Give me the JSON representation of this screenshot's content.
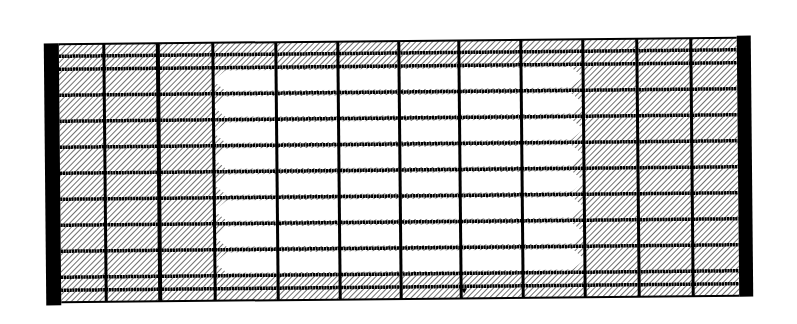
{
  "diagram": {
    "type": "hatched-grid-schematic",
    "rotation_deg": -0.55,
    "colors": {
      "background": "#ffffff",
      "ink": "#000000",
      "hatch_fill": "#ffffff",
      "hatch_line": "#4a4a4a",
      "open_band": "#ffffff"
    },
    "frame": {
      "x": 45,
      "y": 41,
      "width": 707,
      "height": 258,
      "left_bar_width": 15,
      "right_bar_width": 14
    },
    "columns_x": [
      60,
      105,
      159,
      214,
      277,
      339,
      400,
      460,
      522,
      584,
      638,
      692,
      738
    ],
    "rows_y": [
      41,
      53,
      66,
      92,
      118,
      144,
      170,
      196,
      222,
      248,
      274,
      287,
      299
    ],
    "column_line_widths": [
      0,
      3,
      4,
      3,
      3,
      3,
      3,
      3,
      3,
      3,
      3,
      3,
      0
    ],
    "row_line_width": 3.5,
    "bands": {
      "count": 8,
      "first_row_index": 2,
      "left_x": 214,
      "right_x": 584,
      "point_depth": 12,
      "inset": 3
    },
    "marker": {
      "name": "small-triangle-marker",
      "x": 463,
      "y": 291
    }
  }
}
